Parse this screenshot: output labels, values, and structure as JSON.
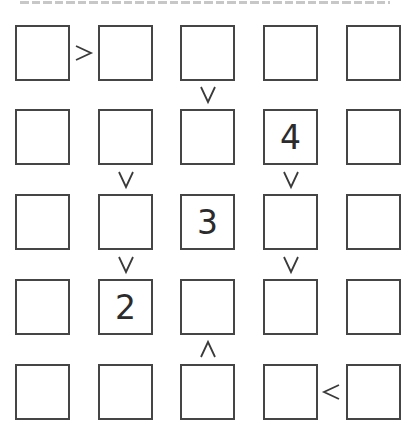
{
  "puzzle": {
    "type": "futoshiki",
    "size": 5,
    "grid": [
      [
        "",
        "",
        "",
        "",
        ""
      ],
      [
        "",
        "",
        "",
        "4",
        ""
      ],
      [
        "",
        "",
        "3",
        "",
        ""
      ],
      [
        "",
        "2",
        "",
        "",
        ""
      ],
      [
        "",
        "",
        "",
        "",
        ""
      ]
    ],
    "constraints": [
      {
        "between": [
          [
            0,
            0
          ],
          [
            0,
            1
          ]
        ],
        "symbol": ">",
        "orientation": "horizontal"
      },
      {
        "between": [
          [
            0,
            2
          ],
          [
            1,
            2
          ]
        ],
        "symbol": "∨",
        "orientation": "vertical",
        "meaning": "top > bottom"
      },
      {
        "between": [
          [
            1,
            1
          ],
          [
            2,
            1
          ]
        ],
        "symbol": "∨",
        "orientation": "vertical",
        "meaning": "top > bottom"
      },
      {
        "between": [
          [
            1,
            3
          ],
          [
            2,
            3
          ]
        ],
        "symbol": "∨",
        "orientation": "vertical",
        "meaning": "top > bottom"
      },
      {
        "between": [
          [
            2,
            1
          ],
          [
            3,
            1
          ]
        ],
        "symbol": "∨",
        "orientation": "vertical",
        "meaning": "top > bottom"
      },
      {
        "between": [
          [
            2,
            3
          ],
          [
            3,
            3
          ]
        ],
        "symbol": "∨",
        "orientation": "vertical",
        "meaning": "top > bottom"
      },
      {
        "between": [
          [
            3,
            2
          ],
          [
            4,
            2
          ]
        ],
        "symbol": "∧",
        "orientation": "vertical",
        "meaning": "top < bottom"
      },
      {
        "between": [
          [
            4,
            3
          ],
          [
            4,
            4
          ]
        ],
        "symbol": "<",
        "orientation": "horizontal"
      }
    ]
  },
  "colors": {
    "cell_border": "#454545",
    "digit": "#2b2b2b",
    "sign": "#3a3a3a",
    "background": "#ffffff"
  }
}
